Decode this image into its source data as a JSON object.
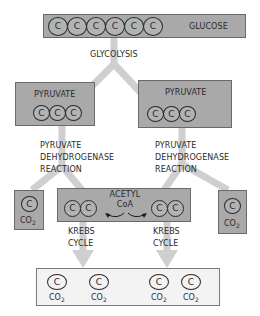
{
  "diagram": {
    "colors": {
      "box_fill": "#a9a9a9",
      "box_border": "#6a6a6a",
      "flow_arrow": "#cfcfcf",
      "final_box_fill": "#f3f3f3",
      "text": "#2a2a2a"
    },
    "carbon_symbol": "C",
    "glucose": {
      "label": "GLUCOSE",
      "carbons": [
        "C",
        "C",
        "C",
        "C",
        "C",
        "C"
      ]
    },
    "glycolysis_label": "GLYCOLYSIS",
    "pyruvate_left": {
      "label": "PYRUVATE",
      "carbons": [
        "C",
        "C",
        "C"
      ]
    },
    "pyruvate_right": {
      "label": "PYRUVATE",
      "carbons": [
        "C",
        "C",
        "C"
      ]
    },
    "pdh_left": {
      "line1": "PYRUVATE",
      "line2": "DEHYDROGENASE",
      "line3": "REACTION"
    },
    "pdh_right": {
      "line1": "PYRUVATE",
      "line2": "DEHYDROGENASE",
      "line3": "REACTION"
    },
    "co2_left": {
      "carbon": "C",
      "label": "CO",
      "sub": "2"
    },
    "co2_right": {
      "carbon": "C",
      "label": "CO",
      "sub": "2"
    },
    "acetyl_coa": {
      "line1": "ACETYL",
      "line2": "CoA",
      "left_carbons": [
        "C",
        "C"
      ],
      "right_carbons": [
        "C",
        "C"
      ]
    },
    "krebs_left": {
      "line1": "KREBS",
      "line2": "CYCLE"
    },
    "krebs_right": {
      "line1": "KREBS",
      "line2": "CYCLE"
    },
    "final_products": [
      {
        "carbon": "C",
        "label": "CO",
        "sub": "2"
      },
      {
        "carbon": "C",
        "label": "CO",
        "sub": "2"
      },
      {
        "carbon": "C",
        "label": "CO",
        "sub": "2"
      },
      {
        "carbon": "C",
        "label": "CO",
        "sub": "2"
      }
    ]
  }
}
